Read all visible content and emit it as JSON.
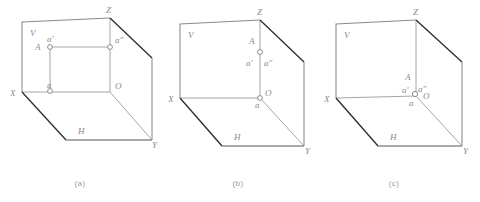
{
  "figure": {
    "colors": {
      "edge_dark": "#2b2b2b",
      "edge_gray": "#8c8c8c",
      "thin_gray": "#a6a6a6",
      "label": "#8a8a8a",
      "caption": "#9a9a9a",
      "background": "#ffffff"
    },
    "diagrams": [
      {
        "id": "a",
        "caption": "(a)",
        "description": "Point A located in space: projections a' on V, a'' on W, a on H form a rectangle",
        "labels": {
          "plane_v": "V",
          "plane_h": "H",
          "axis_x": "X",
          "axis_y": "Y",
          "axis_z": "Z",
          "origin": "O",
          "point_a": "A",
          "proj_v": "a'",
          "proj_w": "a\"",
          "proj_h": "a"
        },
        "points": [
          {
            "name": "a'",
            "x": 50,
            "y": 47
          },
          {
            "name": "a\"",
            "x": 110,
            "y": 47
          },
          {
            "name": "a",
            "x": 50,
            "y": 91
          }
        ]
      },
      {
        "id": "b",
        "caption": "(b)",
        "description": "Point A on the Z axis: a' and a'' coincide on the OZ axis, a coincides with O",
        "labels": {
          "plane_v": "V",
          "plane_h": "H",
          "axis_x": "X",
          "axis_y": "Y",
          "axis_z": "Z",
          "origin": "O",
          "point_a": "A",
          "proj_v": "a'",
          "proj_w": "a\"",
          "proj_h": "a"
        },
        "points": [
          {
            "name": "a'a\"",
            "x": 102,
            "y": 52
          },
          {
            "name": "a",
            "x": 102,
            "y": 98
          }
        ]
      },
      {
        "id": "c",
        "caption": "(c)",
        "description": "Point A at the origin O: all three projections a', a'' and a coincide with O",
        "labels": {
          "plane_v": "V",
          "plane_h": "H",
          "axis_x": "X",
          "axis_y": "Y",
          "axis_z": "Z",
          "origin": "O",
          "point_a": "A",
          "proj_v": "a'",
          "proj_w": "a\"",
          "proj_h": "a"
        },
        "points": [
          {
            "name": "a'a\"a",
            "x": 101,
            "y": 93
          }
        ]
      }
    ]
  }
}
